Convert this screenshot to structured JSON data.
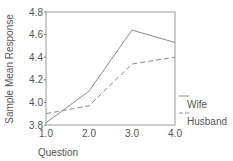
{
  "chart_data": {
    "type": "line",
    "title": "",
    "xlabel": "Question",
    "ylabel": "Sample Mean Response",
    "x": [
      1.0,
      2.0,
      3.0,
      4.0
    ],
    "xticks": [
      "1.0",
      "2.0",
      "3.0",
      "4.0"
    ],
    "yticks": [
      "3.8",
      "4.0",
      "4.2",
      "4.4",
      "4.6",
      "4.8"
    ],
    "ylim": [
      3.8,
      4.8
    ],
    "xlim": [
      1.0,
      4.0
    ],
    "grid": false,
    "legend_position": "right-bottom",
    "series": [
      {
        "name": "Wife",
        "style": "solid",
        "values": [
          3.82,
          4.1,
          4.64,
          4.53
        ]
      },
      {
        "name": "Husband",
        "style": "dashed",
        "values": [
          3.9,
          3.97,
          4.34,
          4.4
        ]
      }
    ]
  },
  "colors": {
    "line": "#8a8a8a",
    "axis": "#8a8a8a",
    "text": "#555555"
  }
}
